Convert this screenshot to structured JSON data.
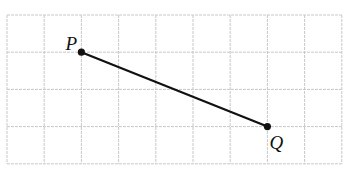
{
  "diagram": {
    "type": "grid-line-segment",
    "grid": {
      "columns": 9,
      "rows": 4,
      "origin_px": [
        7,
        15
      ],
      "cell_px": 37.2,
      "line_color": "#c8c8c8",
      "line_style": "dashed"
    },
    "segment": {
      "color": "#111111",
      "from": "P",
      "to": "Q"
    },
    "points": [
      {
        "name": "P",
        "label": "P",
        "grid": [
          2,
          1
        ]
      },
      {
        "name": "Q",
        "label": "Q",
        "grid": [
          7,
          3
        ]
      }
    ]
  }
}
